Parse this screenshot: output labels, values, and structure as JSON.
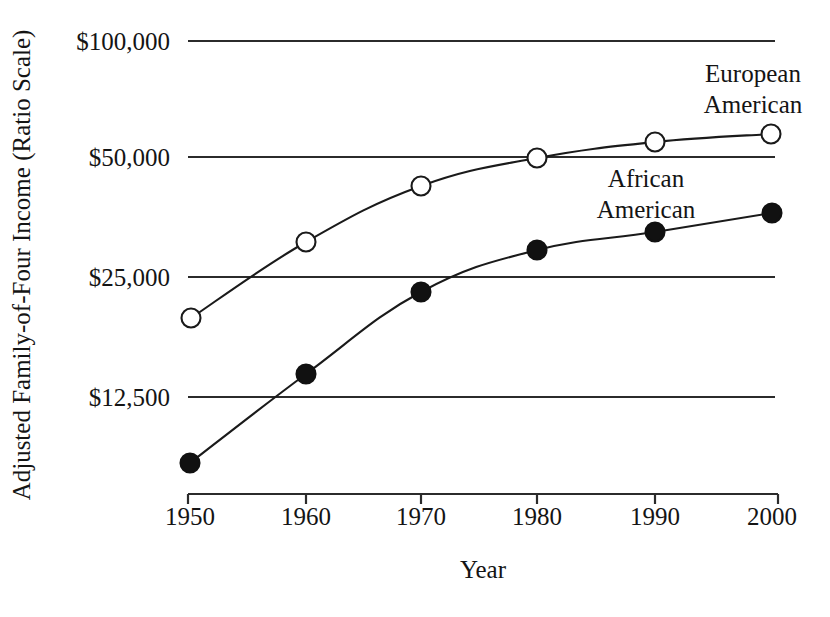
{
  "chart_data": {
    "type": "line",
    "title": "",
    "subtitle": "",
    "xlabel": "Year",
    "ylabel": "Adjusted Family-of-Four Income (Ratio Scale)",
    "x": [
      1950,
      1960,
      1970,
      1980,
      1990,
      2000
    ],
    "x_tick_labels": [
      "1950",
      "1960",
      "1970",
      "1980",
      "1990",
      "2000"
    ],
    "y_scale": "log",
    "y_tick_values": [
      100000,
      50000,
      25000,
      12500
    ],
    "y_tick_labels": [
      "$100,000",
      "$50,000",
      "$25,000",
      "$12,500"
    ],
    "ylim": [
      7000,
      115000
    ],
    "grid": true,
    "grid_orientation": "horizontal",
    "legend_position": "inline-annotation",
    "series": [
      {
        "name": "European American",
        "marker": "open-circle",
        "values": [
          21000,
          32000,
          44000,
          50000,
          55000,
          58000
        ],
        "annotation": {
          "lines": [
            "European",
            "American"
          ],
          "x": 1996,
          "y": 86000
        }
      },
      {
        "name": "African American",
        "marker": "filled-circle",
        "values": [
          8500,
          14500,
          23000,
          30000,
          34000,
          39000
        ],
        "annotation": {
          "lines": [
            "African",
            "American"
          ],
          "x": 1988,
          "y": 41500
        }
      }
    ],
    "colors": {
      "line": "#1a1a1a",
      "gridline": "#2b2b2b",
      "axis": "#2b2b2b",
      "open_marker_fill": "#ffffff",
      "filled_marker_fill": "#111111",
      "background": "#ffffff",
      "text": "#141414"
    }
  },
  "geometry": {
    "plot_left": 188,
    "plot_right": 778,
    "gridline_right": 775,
    "axis_baseline_y": 494,
    "tick_length": 10,
    "y_pixel_for": {
      "100000": 41,
      "50000": 157,
      "25000": 277,
      "12500": 397
    },
    "x_pixel_for": {
      "1950": 190,
      "1960": 306,
      "1970": 421,
      "1980": 537,
      "1990": 655,
      "2000": 772
    },
    "series_pixels": {
      "European American": [
        {
          "x": 191,
          "y": 318
        },
        {
          "x": 306,
          "y": 242
        },
        {
          "x": 421,
          "y": 186
        },
        {
          "x": 537,
          "y": 158
        },
        {
          "x": 655,
          "y": 142
        },
        {
          "x": 771,
          "y": 134
        }
      ],
      "African American": [
        {
          "x": 190,
          "y": 463
        },
        {
          "x": 306,
          "y": 374
        },
        {
          "x": 421,
          "y": 292
        },
        {
          "x": 537,
          "y": 250
        },
        {
          "x": 655,
          "y": 232
        },
        {
          "x": 772,
          "y": 213
        }
      ]
    },
    "marker_radius_open": 9.5,
    "marker_radius_filled": 9.5,
    "y_label_x": 170,
    "x_label_y": 525,
    "xlabel_pos": {
      "x": 483,
      "y": 578
    },
    "ylabel_pos": {
      "x": 30,
      "y": 265
    },
    "annotation_pixels": {
      "European American": [
        {
          "text": "European",
          "x": 753,
          "y": 82
        },
        {
          "text": "American",
          "x": 753,
          "y": 113
        }
      ],
      "African American": [
        {
          "text": "African",
          "x": 646,
          "y": 187
        },
        {
          "text": "American",
          "x": 646,
          "y": 218
        }
      ]
    }
  }
}
